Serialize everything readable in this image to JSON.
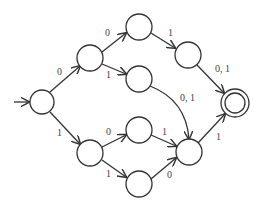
{
  "diagram": {
    "type": "finite-automaton",
    "colors": {
      "stroke": "#333333",
      "label": "#444444",
      "background": "#ffffff"
    },
    "states": [
      {
        "id": "q0",
        "x": 42,
        "y": 102,
        "r": 12,
        "start": true,
        "accept": false
      },
      {
        "id": "q1",
        "x": 90,
        "y": 58,
        "r": 13,
        "start": false,
        "accept": false
      },
      {
        "id": "q2",
        "x": 139,
        "y": 27,
        "r": 13,
        "start": false,
        "accept": false
      },
      {
        "id": "q3",
        "x": 188,
        "y": 55,
        "r": 13,
        "start": false,
        "accept": false
      },
      {
        "id": "q4",
        "x": 139,
        "y": 79,
        "r": 13,
        "start": false,
        "accept": false
      },
      {
        "id": "q5",
        "x": 235,
        "y": 103,
        "r": 14,
        "start": false,
        "accept": true
      },
      {
        "id": "q6",
        "x": 90,
        "y": 153,
        "r": 13,
        "start": false,
        "accept": false
      },
      {
        "id": "q7",
        "x": 139,
        "y": 130,
        "r": 13,
        "start": false,
        "accept": false
      },
      {
        "id": "q8",
        "x": 139,
        "y": 184,
        "r": 13,
        "start": false,
        "accept": false
      },
      {
        "id": "q9",
        "x": 189,
        "y": 152,
        "r": 13,
        "start": false,
        "accept": false
      }
    ],
    "transitions": [
      {
        "from": "q0",
        "to": "q1",
        "label": "0"
      },
      {
        "from": "q1",
        "to": "q2",
        "label": "0"
      },
      {
        "from": "q1",
        "to": "q4",
        "label": "1"
      },
      {
        "from": "q2",
        "to": "q3",
        "label": "1"
      },
      {
        "from": "q3",
        "to": "q5",
        "label": "0, 1"
      },
      {
        "from": "q4",
        "to": "q9",
        "label": "0, 1"
      },
      {
        "from": "q0",
        "to": "q6",
        "label": "1"
      },
      {
        "from": "q6",
        "to": "q7",
        "label": "0"
      },
      {
        "from": "q6",
        "to": "q8",
        "label": "1"
      },
      {
        "from": "q7",
        "to": "q9",
        "label": "1"
      },
      {
        "from": "q8",
        "to": "q9",
        "label": "0"
      },
      {
        "from": "q9",
        "to": "q5",
        "label": "1"
      }
    ],
    "labels": {
      "e_q0_q1": "0",
      "e_q1_q2": "0",
      "e_q1_q4": "1",
      "e_q2_q3": "1",
      "e_q3_q5": "0, 1",
      "e_q4_q9": "0, 1",
      "e_q0_q6": "1",
      "e_q6_q7": "0",
      "e_q6_q8": "1",
      "e_q7_q9": "1",
      "e_q8_q9": "0",
      "e_q9_q5": "1"
    }
  }
}
